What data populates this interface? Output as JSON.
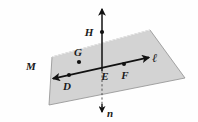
{
  "figure": {
    "background_color": "#fefefe",
    "plane": {
      "name": "M",
      "label": "M",
      "fill_color": "#d3d3d3",
      "stroke_color": "#8a8a8a",
      "label_x": 26,
      "label_y": 70,
      "corners": [
        [
          52,
          57
        ],
        [
          150,
          30
        ],
        [
          185,
          78
        ],
        [
          49,
          105
        ]
      ]
    },
    "line_l": {
      "label": "ℓ",
      "label_x": 152,
      "label_y": 61,
      "color": "#111111",
      "x1": 52,
      "y1": 79,
      "x2": 150,
      "y2": 57,
      "arrow_both_ends": true
    },
    "line_n": {
      "label": "n",
      "label_x": 110,
      "label_y": 116,
      "color": "#111111",
      "x": 102,
      "y_top": 8,
      "y_plane": 71,
      "y_bottom": 112,
      "solid_above_plane": true,
      "dashed_below_plane": true,
      "arrow_both_ends": true
    },
    "points": [
      {
        "name": "H",
        "label": "H",
        "x": 102,
        "y": 32,
        "label_x": 89,
        "label_y": 36,
        "on_line": "n",
        "dot": true
      },
      {
        "name": "G",
        "label": "G",
        "x": 79,
        "y": 62,
        "label_x": 74,
        "label_y": 56,
        "on_line": "none",
        "dot": true
      },
      {
        "name": "D",
        "label": "D",
        "x": 69,
        "y": 75,
        "label_x": 63,
        "label_y": 89,
        "on_line": "l",
        "dot": true
      },
      {
        "name": "E",
        "label": "E",
        "x": 102,
        "y": 71,
        "label_x": 102,
        "label_y": 79,
        "on_line": "both",
        "dot": false
      },
      {
        "name": "F",
        "label": "F",
        "x": 124,
        "y": 66,
        "label_x": 121,
        "label_y": 79,
        "on_line": "l",
        "dot": true
      }
    ],
    "labels_list": [
      "M",
      "H",
      "G",
      "D",
      "E",
      "F",
      "ℓ",
      "n"
    ]
  }
}
